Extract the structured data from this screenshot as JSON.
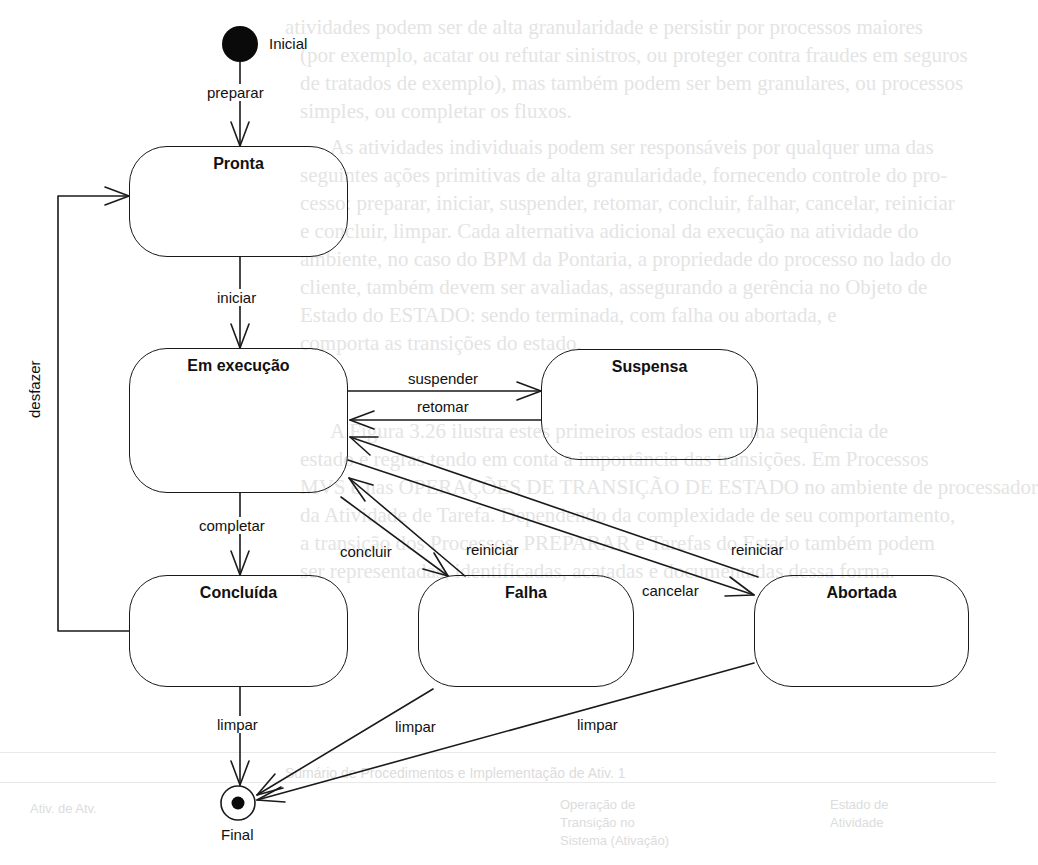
{
  "background": {
    "paragraph_lines": [
      "atividades podem ser de alta granularidade e persistir por processos maiores",
      "(por exemplo, acatar ou refutar sinistros, ou proteger contra fraudes em seguros",
      "de tratados de exemplo), mas também podem ser bem granulares, ou processos",
      "simples, ou completar os fluxos.",
      "As atividades individuais podem ser responsáveis por qualquer uma das",
      "seguintes ações primitivas de alta granularidade, fornecendo controle do pro-",
      "cesso: preparar, iniciar, suspender, retomar, concluir, falhar, cancelar, reiniciar",
      "e concluir, limpar. Cada alternativa adicional da execução na atividade do",
      "ambiente, no caso do BPM da Pontaria, a propriedade do processo no lado do",
      "cliente, também devem ser avaliadas, assegurando a gerência no Objeto de",
      "Estado do ESTADO: sendo terminada, com falha ou abortada, e",
      "comporta as transições do estado.",
      "A Figura 3.26 ilustra estes primeiros estados em uma sequência de",
      "estado e regras tendo em conta a importância das transições. Em Processos",
      "MVS e nas OPERAÇÕES DE TRANSIÇÃO DE ESTADO no ambiente de processador",
      "da Atividade de Tarefa. Dependendo da complexidade de seu comportamento,",
      "a transição dos Processos, PREPARAR e Tarefas do Estado também podem",
      "ser representadas, identificadas, acatadas e documentadas dessa forma."
    ],
    "table_caption": "Sumário de Procedimentos e Implementação de Ativ. 1",
    "table_cells": [
      "Ativ. de Atv.",
      "Operação de Transição no Sistema (Ativação)",
      "Estado de Atividade"
    ]
  },
  "diagram": {
    "initial": {
      "label": "Inicial"
    },
    "final": {
      "label": "Final"
    },
    "states": {
      "pronta": {
        "name": "Pronta"
      },
      "em_execucao": {
        "name": "Em execução"
      },
      "suspensa": {
        "name": "Suspensa"
      },
      "concluida": {
        "name": "Concluída"
      },
      "falha": {
        "name": "Falha"
      },
      "abortada": {
        "name": "Abortada"
      }
    },
    "transitions": {
      "preparar": "preparar",
      "iniciar": "iniciar",
      "suspender": "suspender",
      "retomar": "retomar",
      "completar": "completar",
      "concluir": "concluir",
      "reiniciar_falha": "reiniciar",
      "reiniciar_abortada": "reiniciar",
      "cancelar": "cancelar",
      "desfazer": "desfazer",
      "limpar_concluida": "limpar",
      "limpar_falha": "limpar",
      "limpar_abortada": "limpar"
    },
    "colors": {
      "stroke": "#1a1a1a",
      "text": "#111111",
      "background_text": "#e4e4e4"
    }
  }
}
